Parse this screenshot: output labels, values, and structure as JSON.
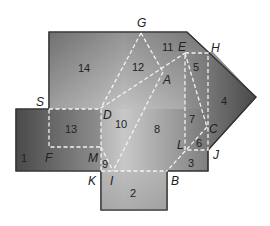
{
  "diagram": {
    "type": "folded-net",
    "colors": {
      "fill_light": "#c4c4c4",
      "fill_dark": "#4a4a4a",
      "outline": "#333333",
      "fold_line": "#f2f2f2",
      "text": "#222222"
    },
    "point_labels": {
      "G": "G",
      "E": "E",
      "H": "H",
      "A": "A",
      "S": "S",
      "D": "D",
      "C": "C",
      "L": "L",
      "J": "J",
      "F": "F",
      "M": "M",
      "K": "K",
      "I": "I",
      "B": "B"
    },
    "region_labels": {
      "r1": "1",
      "r2": "2",
      "r3": "3",
      "r4": "4",
      "r5": "5",
      "r6": "6",
      "r7": "7",
      "r8": "8",
      "r9": "9",
      "r10": "10",
      "r11": "11",
      "r12": "12",
      "r13": "13",
      "r14": "14"
    }
  }
}
